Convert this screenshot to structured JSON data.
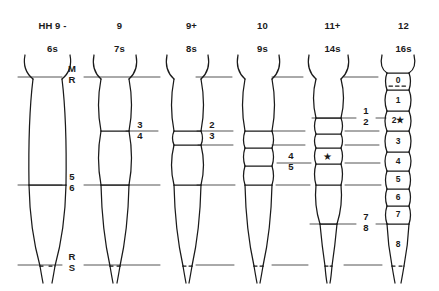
{
  "figure": {
    "type": "embryo-somite-stage-diagram",
    "ink_color": "#1a1a1a",
    "line_color": "#4a4a4a",
    "background": "#ffffff"
  },
  "columns": [
    {
      "stage": "HH 9 -",
      "somites": "6s",
      "cx": 47,
      "segments": 0
    },
    {
      "stage": "9",
      "somites": "7s",
      "cx": 114,
      "segments": 2
    },
    {
      "stage": "9+",
      "somites": "8s",
      "cx": 186,
      "segments": 3
    },
    {
      "stage": "10",
      "somites": "9s",
      "cx": 257,
      "segments": 4
    },
    {
      "stage": "11+",
      "somites": "14s",
      "cx": 327,
      "segments": 7
    },
    {
      "stage": "12",
      "somites": "16s",
      "cx": 398,
      "segments": 9
    }
  ],
  "level_labels": [
    {
      "top": "M",
      "bot": "R",
      "x": 72,
      "y": 64
    },
    {
      "top": "3",
      "bot": "4",
      "x": 140,
      "y": 120
    },
    {
      "top": "2",
      "bot": "3",
      "x": 212,
      "y": 120
    },
    {
      "top": "1",
      "bot": "2",
      "x": 366,
      "y": 105
    },
    {
      "top": "5",
      "bot": "6",
      "x": 72,
      "y": 173
    },
    {
      "top": "4",
      "bot": "5",
      "x": 291,
      "y": 160
    },
    {
      "top": "7",
      "bot": "8",
      "x": 366,
      "y": 211
    },
    {
      "top": "R",
      "bot": "S",
      "x": 72,
      "y": 252
    }
  ],
  "somite_numbers": [
    {
      "label": "0",
      "y": 79
    },
    {
      "label": "1",
      "y": 101
    },
    {
      "label": "2★",
      "y": 121
    },
    {
      "label": "3",
      "y": 142
    },
    {
      "label": "4",
      "y": 162
    },
    {
      "label": "5",
      "y": 180
    },
    {
      "label": "6",
      "y": 197
    },
    {
      "label": "7",
      "y": 214
    },
    {
      "label": "8",
      "y": 243
    }
  ],
  "markers": {
    "star_glyph": "★",
    "star_on_column": "11+",
    "star_y": 156,
    "dashed_divider_in_somite": "0"
  }
}
